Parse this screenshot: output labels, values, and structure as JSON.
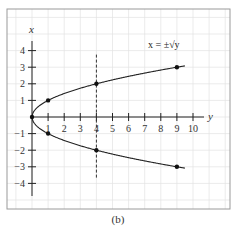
{
  "chart_data": {
    "type": "line",
    "title": "",
    "caption": "(b)",
    "xlabel": "y",
    "ylabel": "x",
    "annotation": "x = ±√y",
    "xlim": [
      0,
      10
    ],
    "ylim": [
      -4,
      4
    ],
    "x_ticks": [
      1,
      2,
      3,
      4,
      5,
      6,
      7,
      8,
      9,
      10
    ],
    "y_ticks": [
      -4,
      -3,
      -2,
      -1,
      1,
      2,
      3,
      4
    ],
    "grid": true,
    "series": [
      {
        "name": "x = +√y",
        "x": [
          0,
          1,
          4,
          9,
          9.5
        ],
        "values": [
          0,
          1,
          2,
          3,
          3.08
        ]
      },
      {
        "name": "x = -√y",
        "x": [
          0,
          1,
          4,
          9,
          9.5
        ],
        "values": [
          0,
          -1,
          -2,
          -3,
          -3.08
        ]
      }
    ],
    "marked_points": [
      {
        "y": 0,
        "x": 0
      },
      {
        "y": 1,
        "x": 1
      },
      {
        "y": 1,
        "x": -1
      },
      {
        "y": 4,
        "x": 2
      },
      {
        "y": 4,
        "x": -2
      },
      {
        "y": 9,
        "x": 3
      },
      {
        "y": 9,
        "x": -3
      }
    ],
    "reference_line": {
      "type": "vertical",
      "style": "dashed",
      "at": 4,
      "from": -4,
      "to": 4
    }
  }
}
